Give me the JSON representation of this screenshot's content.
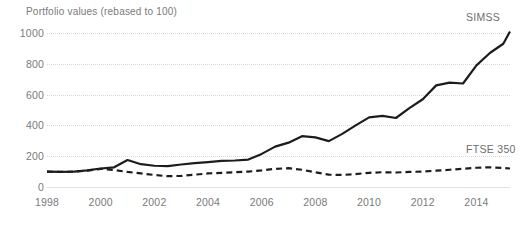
{
  "chart_data": {
    "type": "line",
    "title": "Portfolio values (rebased to 100)",
    "xlabel": "",
    "ylabel": "",
    "xlim": [
      1998,
      2015.25
    ],
    "ylim": [
      0,
      1000
    ],
    "grid": true,
    "legend_position": "inline-right-end",
    "y_ticks": [
      1000,
      800,
      600,
      400,
      200,
      0
    ],
    "y_tick_labels": [
      "1000",
      "800",
      "600",
      "400",
      "200",
      "0"
    ],
    "x_ticks": [
      1998,
      2000,
      2002,
      2004,
      2006,
      2008,
      2010,
      2012,
      2014
    ],
    "x_tick_labels": [
      "1998",
      "2000",
      "2002",
      "2004",
      "2006",
      "2008",
      "2010",
      "2012",
      "2014"
    ],
    "x": [
      1998.0,
      1998.5,
      1999.0,
      1999.5,
      2000.0,
      2000.5,
      2001.0,
      2001.5,
      2002.0,
      2002.5,
      2003.0,
      2003.5,
      2004.0,
      2004.5,
      2005.0,
      2005.5,
      2006.0,
      2006.5,
      2007.0,
      2007.5,
      2008.0,
      2008.5,
      2009.0,
      2009.5,
      2010.0,
      2010.5,
      2011.0,
      2011.5,
      2012.0,
      2012.5,
      2013.0,
      2013.5,
      2014.0,
      2014.5,
      2015.0,
      2015.25
    ],
    "series": [
      {
        "name": "SIMSS",
        "style": "solid",
        "color": "#1c1c1c",
        "end_label": "SIMSS",
        "values": [
          100,
          98,
          100,
          108,
          120,
          128,
          175,
          148,
          138,
          136,
          146,
          155,
          162,
          170,
          172,
          178,
          215,
          262,
          288,
          330,
          322,
          298,
          345,
          400,
          452,
          462,
          448,
          512,
          570,
          660,
          678,
          672,
          790,
          870,
          930,
          1010
        ]
      },
      {
        "name": "FTSE 350",
        "style": "dashed",
        "color": "#1c1c1c",
        "end_label": "FTSE 350",
        "values": [
          100,
          98,
          100,
          106,
          118,
          110,
          98,
          88,
          78,
          70,
          72,
          80,
          88,
          92,
          96,
          100,
          108,
          118,
          122,
          112,
          95,
          80,
          78,
          84,
          92,
          96,
          94,
          98,
          100,
          106,
          112,
          118,
          125,
          128,
          124,
          120
        ]
      }
    ]
  }
}
